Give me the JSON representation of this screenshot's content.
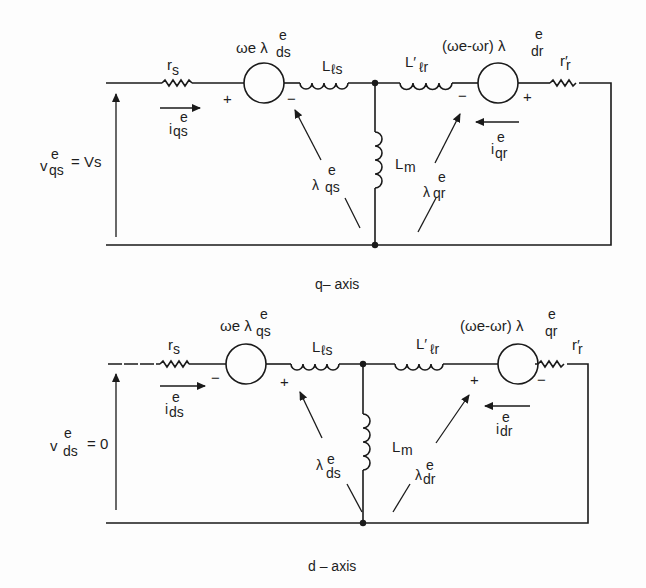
{
  "diagram": {
    "q_axis": {
      "caption": "q– axis",
      "source_voltage": {
        "sym": "v",
        "sup": "e",
        "sub": "qs",
        "rhs": "= Vs"
      },
      "stator_resistance": {
        "sym": "r",
        "sub": "s"
      },
      "stator_emf": {
        "prefix": "ωe λ",
        "sup": "e",
        "sub": "ds",
        "left_polarity": "+",
        "right_polarity": "−"
      },
      "stator_current": {
        "sym": "i",
        "sup": "e",
        "sub": "qs"
      },
      "stator_leakage": {
        "sym": "L",
        "sub": "ℓs"
      },
      "rotor_leakage": {
        "sym": "L′",
        "sub": "ℓr"
      },
      "magnetizing": {
        "sym": "L",
        "sub": "m"
      },
      "rotor_emf": {
        "prefix": "(ωe-ωr) λ",
        "sup": "e",
        "sub": "dr",
        "left_polarity": "−",
        "right_polarity": "+"
      },
      "rotor_resistance": {
        "sym": "r′",
        "sub": "r"
      },
      "rotor_current": {
        "sym": "i",
        "sup": "e",
        "sub": "qr"
      },
      "stator_flux": {
        "sym": "λ",
        "sup": "e",
        "sub": "qs"
      },
      "rotor_flux": {
        "sym": "λ",
        "sup": "e",
        "sub": "qr"
      }
    },
    "d_axis": {
      "caption": "d – axis",
      "source_voltage": {
        "sym": "v",
        "sup": "e",
        "sub": "ds",
        "rhs": "= 0"
      },
      "stator_resistance": {
        "sym": "r",
        "sub": "s"
      },
      "stator_emf": {
        "prefix": "ωe λ",
        "sup": "e",
        "sub": "qs",
        "left_polarity": "−",
        "right_polarity": "+"
      },
      "stator_current": {
        "sym": "i",
        "sup": "e",
        "sub": "ds"
      },
      "stator_leakage": {
        "sym": "L",
        "sub": "ℓs"
      },
      "rotor_leakage": {
        "sym": "L′",
        "sub": "ℓr"
      },
      "magnetizing": {
        "sym": "L",
        "sub": "m"
      },
      "rotor_emf": {
        "prefix": "(ωe-ωr) λ",
        "sup": "e",
        "sub": "qr",
        "left_polarity": "+",
        "right_polarity": "−"
      },
      "rotor_resistance": {
        "sym": "r′",
        "sub": "r"
      },
      "rotor_current": {
        "sym": "i",
        "sup": "e",
        "sub": "dr"
      },
      "stator_flux": {
        "sym": "λ",
        "sup": "e",
        "sub": "ds"
      },
      "rotor_flux": {
        "sym": "λ",
        "sup": "e",
        "sub": "dr"
      }
    }
  }
}
